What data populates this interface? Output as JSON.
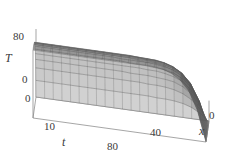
{
  "figure": {
    "type": "surface-plot",
    "background_color": "#ffffff",
    "line_color": "#555555",
    "axis_color": "#808080",
    "width": 229,
    "height": 162
  },
  "axes": {
    "vertical": {
      "name": "T",
      "ticks": [
        "80",
        "0"
      ],
      "tick_values": [
        80,
        0
      ]
    },
    "depth": {
      "name": "t",
      "ticks": [
        "10",
        "0"
      ],
      "tick_values": [
        10,
        0
      ]
    },
    "horizontal": {
      "name": "x",
      "ticks": [
        "80",
        "40",
        "0"
      ],
      "tick_values": [
        80,
        40,
        0
      ]
    }
  },
  "chart_data": {
    "type": "surface",
    "title": "",
    "xlabel": "x",
    "ylabel": "t",
    "zlabel": "T",
    "xlim": [
      0,
      100
    ],
    "ylim": [
      0,
      15
    ],
    "zlim": [
      0,
      100
    ],
    "xticks": [
      0,
      40,
      80
    ],
    "yticks": [
      0,
      10
    ],
    "zticks": [
      0,
      80
    ],
    "grid": false,
    "legend": null,
    "colormap": "gray",
    "shading": "mesh-wireframe",
    "x": [
      0,
      5,
      10,
      15,
      20,
      25,
      30,
      35,
      40,
      45,
      50,
      55,
      60,
      65,
      70,
      75,
      80,
      85,
      90,
      95,
      100
    ],
    "t": [
      0,
      0.75,
      1.5,
      2.25,
      3,
      3.75,
      4.5,
      5.25,
      6,
      6.75,
      7.5,
      8.25,
      9,
      9.75,
      10.5,
      11.25,
      12,
      12.75,
      13.5,
      14.25,
      15
    ],
    "z_surface_note": "T(x,t) = 100 * (1 - exp(-t/3.2)) * erf-like ramp in x, clamped to 0 at x=0",
    "z_rows": [
      [
        0,
        0,
        0,
        0,
        0,
        0,
        0,
        0,
        0,
        0,
        0,
        0,
        0,
        0,
        0,
        0,
        0,
        0,
        0,
        0,
        0
      ],
      [
        0,
        11,
        18,
        22,
        24,
        25,
        25,
        26,
        26,
        26,
        26,
        26,
        26,
        26,
        26,
        26,
        26,
        26,
        26,
        26,
        26
      ],
      [
        0,
        19,
        31,
        38,
        42,
        44,
        45,
        45,
        46,
        46,
        46,
        46,
        46,
        46,
        46,
        46,
        46,
        46,
        46,
        46,
        46
      ],
      [
        0,
        25,
        41,
        50,
        55,
        57,
        58,
        59,
        59,
        59,
        60,
        60,
        60,
        60,
        60,
        60,
        60,
        60,
        60,
        60,
        60
      ],
      [
        0,
        30,
        48,
        59,
        64,
        67,
        69,
        69,
        70,
        70,
        70,
        70,
        70,
        70,
        70,
        70,
        70,
        70,
        70,
        70,
        70
      ],
      [
        0,
        33,
        54,
        65,
        71,
        74,
        76,
        77,
        77,
        77,
        78,
        78,
        78,
        78,
        78,
        78,
        78,
        78,
        78,
        78,
        78
      ],
      [
        0,
        36,
        58,
        70,
        77,
        80,
        82,
        83,
        83,
        83,
        83,
        84,
        84,
        84,
        84,
        84,
        84,
        84,
        84,
        84,
        84
      ],
      [
        0,
        38,
        61,
        74,
        81,
        84,
        86,
        87,
        87,
        88,
        88,
        88,
        88,
        88,
        88,
        88,
        88,
        88,
        88,
        88,
        88
      ],
      [
        0,
        40,
        64,
        77,
        84,
        88,
        90,
        90,
        91,
        91,
        91,
        91,
        91,
        91,
        91,
        91,
        91,
        91,
        91,
        91,
        91
      ],
      [
        0,
        41,
        66,
        79,
        86,
        90,
        92,
        93,
        93,
        94,
        94,
        94,
        94,
        94,
        94,
        94,
        94,
        94,
        94,
        94,
        94
      ],
      [
        0,
        42,
        67,
        81,
        88,
        92,
        94,
        95,
        95,
        96,
        96,
        96,
        96,
        96,
        96,
        96,
        96,
        96,
        96,
        96,
        96
      ],
      [
        0,
        43,
        68,
        82,
        90,
        94,
        96,
        96,
        97,
        97,
        97,
        97,
        97,
        97,
        97,
        97,
        97,
        97,
        97,
        97,
        97
      ],
      [
        0,
        43,
        69,
        83,
        91,
        95,
        97,
        97,
        98,
        98,
        98,
        98,
        98,
        98,
        98,
        98,
        98,
        98,
        98,
        98,
        98
      ],
      [
        0,
        44,
        70,
        84,
        91,
        95,
        97,
        98,
        98,
        99,
        99,
        99,
        99,
        99,
        99,
        99,
        99,
        99,
        99,
        99,
        99
      ],
      [
        0,
        44,
        70,
        84,
        92,
        96,
        98,
        99,
        99,
        99,
        99,
        99,
        99,
        99,
        99,
        99,
        99,
        99,
        99,
        99,
        99
      ],
      [
        0,
        44,
        71,
        85,
        92,
        96,
        98,
        99,
        99,
        100,
        100,
        100,
        100,
        100,
        100,
        100,
        100,
        100,
        100,
        100,
        100
      ],
      [
        0,
        45,
        71,
        85,
        93,
        97,
        99,
        99,
        100,
        100,
        100,
        100,
        100,
        100,
        100,
        100,
        100,
        100,
        100,
        100,
        100
      ],
      [
        0,
        45,
        71,
        85,
        93,
        97,
        99,
        100,
        100,
        100,
        100,
        100,
        100,
        100,
        100,
        100,
        100,
        100,
        100,
        100,
        100
      ],
      [
        0,
        45,
        72,
        86,
        93,
        97,
        99,
        100,
        100,
        100,
        100,
        100,
        100,
        100,
        100,
        100,
        100,
        100,
        100,
        100,
        100
      ],
      [
        0,
        45,
        72,
        86,
        93,
        97,
        99,
        100,
        100,
        100,
        100,
        100,
        100,
        100,
        100,
        100,
        100,
        100,
        100,
        100,
        100
      ],
      [
        0,
        45,
        72,
        86,
        94,
        98,
        99,
        100,
        100,
        100,
        100,
        100,
        100,
        100,
        100,
        100,
        100,
        100,
        100,
        100,
        100
      ]
    ]
  }
}
